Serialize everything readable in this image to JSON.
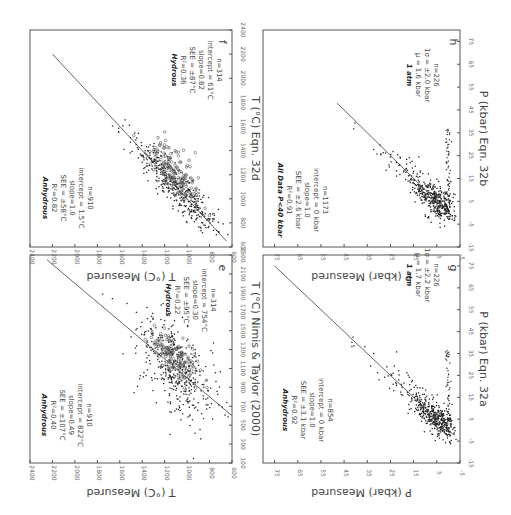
{
  "figure": {
    "orientation": "rotated 90 degrees clockwise",
    "panels_order_screen": [
      "f",
      "h",
      "e",
      "g"
    ]
  },
  "chart_data": [
    {
      "id": "e",
      "type": "scatter",
      "panel_label": "e",
      "xlabel": "T (°C) Nimis & Taylor (2000)",
      "ylabel": "T (°C) Measured",
      "x_ticks": [
        "100",
        "300",
        "500",
        "700",
        "900",
        "1100",
        "1300",
        "1500",
        "1700",
        "1900",
        "2100",
        "2300"
      ],
      "y_ticks": [
        "600",
        "800",
        "1000",
        "1200",
        "1400",
        "1600",
        "1800",
        "2000",
        "2200",
        "2400"
      ],
      "xlim": [
        100,
        2300
      ],
      "ylim": [
        600,
        2400
      ],
      "fit_line": {
        "x": [
          600,
          2250
        ],
        "y": [
          600,
          2250
        ]
      },
      "annotations": {
        "anhydrous": {
          "title": "Anhydrous",
          "r2": "R²=0.40",
          "see": "SEE = ±107°C",
          "slope": "slope=0.49",
          "intercept": "intercept = 822°C",
          "n": "n=910"
        },
        "hydrous": {
          "title": "Hydrous",
          "r2": "R²=0.22",
          "see": "SEE = ±95°C",
          "slope": "slope=0.30",
          "intercept": "intercept = 754°C",
          "n": "n=314"
        }
      },
      "series": [
        {
          "name": "Anhydrous",
          "marker": "filled",
          "n": 910
        },
        {
          "name": "Hydrous",
          "marker": "open",
          "n": 314
        }
      ]
    },
    {
      "id": "f",
      "type": "scatter",
      "panel_label": "f",
      "xlabel": "T (°C) Eqn. 32d",
      "ylabel": "T (°C) Measured",
      "x_ticks": [
        "600",
        "800",
        "1000",
        "1200",
        "1400",
        "1600",
        "1800",
        "2000",
        "2200",
        "2400"
      ],
      "y_ticks": [
        "600",
        "800",
        "1000",
        "1200",
        "1400",
        "1600",
        "1800",
        "2000",
        "2200",
        "2400"
      ],
      "xlim": [
        600,
        2400
      ],
      "ylim": [
        600,
        2400
      ],
      "fit_line": {
        "x": [
          650,
          2200
        ],
        "y": [
          650,
          2200
        ]
      },
      "annotations": {
        "anhydrous": {
          "title": "Anhydrous",
          "r2": "R²=0.82",
          "see": "SEE = ±58°C",
          "slope": "slope=1.0",
          "intercept": "intercept = 1.5°C",
          "n": "n=910"
        },
        "hydrous": {
          "title": "Hydrous",
          "r2": "R²=0.36",
          "see": "SEE = ±87°C",
          "slope": "slope=0.82",
          "intercept": "intercept = 61°C",
          "n": "n=314"
        }
      },
      "series": [
        {
          "name": "Anhydrous",
          "marker": "filled",
          "n": 910
        },
        {
          "name": "Hydrous",
          "marker": "open",
          "n": 314
        }
      ]
    },
    {
      "id": "g",
      "type": "scatter",
      "panel_label": "g",
      "xlabel": "P (kbar) Eqn. 32a",
      "ylabel": "P (kbar) Measured",
      "x_ticks": [
        "-15",
        "-5",
        "5",
        "15",
        "25",
        "35",
        "45",
        "55",
        "65",
        "75"
      ],
      "y_ticks": [
        "-5",
        "5",
        "15",
        "25",
        "35",
        "45",
        "55",
        "65",
        "75"
      ],
      "xlim": [
        -15,
        80
      ],
      "ylim": [
        -5,
        80
      ],
      "fit_line": {
        "x": [
          -2,
          75
        ],
        "y": [
          -2,
          75
        ]
      },
      "annotations": {
        "anhydrous": {
          "title": "Anhydrous",
          "r2": "R²=0.92",
          "see": "SEE = ±3.1 kbar",
          "slope": "slope=1.0",
          "intercept": "intercept = 0 kbar",
          "n": "n=854"
        },
        "one_atm": {
          "title": "1 atm",
          "mu": "μ = 1.7 kbar",
          "sigma": "1σ = ±2.2 kbar",
          "n": "n=226"
        }
      },
      "series": [
        {
          "name": "Anhydrous",
          "marker": "filled",
          "n": 854
        },
        {
          "name": "1 atm",
          "marker": "filled",
          "n": 226
        }
      ]
    },
    {
      "id": "h",
      "type": "scatter",
      "panel_label": "h",
      "xlabel": "P (kbar) Eqn. 32b",
      "ylabel": "P (kbar) Measured",
      "x_ticks": [
        "-15",
        "-5",
        "5",
        "15",
        "25",
        "35",
        "45",
        "55",
        "65",
        "75"
      ],
      "y_ticks": [
        "-5",
        "5",
        "15",
        "25",
        "35",
        "45",
        "55",
        "65",
        "75"
      ],
      "xlim": [
        -15,
        80
      ],
      "ylim": [
        -5,
        80
      ],
      "fit_line": {
        "x": [
          -2,
          48
        ],
        "y": [
          -2,
          48
        ]
      },
      "annotations": {
        "all_data": {
          "title": "All Data P<40 kbar",
          "r2": "R²=0.91",
          "see": "SEE = ±2.6 kbar",
          "slope": "slope=1.0",
          "intercept": "intercept = 0 kbar",
          "n": "n=1173"
        },
        "one_atm": {
          "title": "1 atm",
          "mu": "μ = 1.6 kbar",
          "sigma": "1σ = ±2.0 kbar",
          "n": "n=226"
        }
      },
      "series": [
        {
          "name": "All Data P<40 kbar",
          "marker": "filled",
          "n": 1173
        },
        {
          "name": "1 atm",
          "marker": "filled",
          "n": 226
        }
      ]
    }
  ]
}
